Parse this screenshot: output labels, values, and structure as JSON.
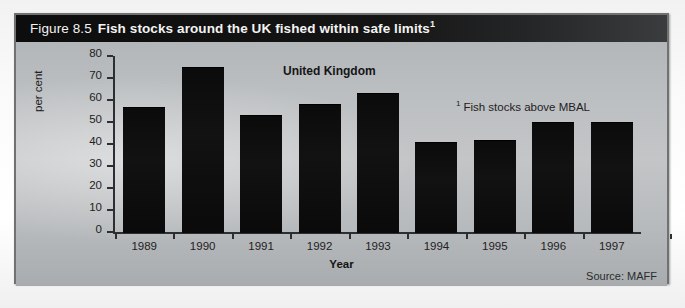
{
  "figure": {
    "number": "Figure 8.5",
    "title": "Fish stocks around the UK fished within safe limits",
    "title_footnote_marker": "1",
    "source": "Source: MAFF",
    "country_annotation": "United Kingdom",
    "footnote_marker": "1",
    "footnote_text": "Fish stocks above MBAL",
    "frame_color": "#6f7173",
    "header_background": "#0d0d0e",
    "header_text_color": "#f3f3f3",
    "bar_color": "#0b0b0c",
    "plot_background": "#bcbfc1"
  },
  "chart_data": {
    "type": "bar",
    "title": "Fish stocks around the UK fished within safe limits",
    "xlabel": "Year",
    "ylabel": "per cent",
    "categories": [
      "1989",
      "1990",
      "1991",
      "1992",
      "1993",
      "1994",
      "1995",
      "1996",
      "1997"
    ],
    "values": [
      57,
      75,
      53,
      58,
      63,
      41,
      42,
      50,
      50
    ],
    "ylim": [
      0,
      80
    ],
    "yticks": [
      0,
      10,
      20,
      30,
      40,
      50,
      60,
      70,
      80
    ],
    "ytick_labels": [
      "0",
      "10",
      "20",
      "30",
      "40",
      "50",
      "60",
      "70",
      "80"
    ],
    "grid": false,
    "legend": false,
    "annotations": [
      {
        "text": "United Kingdom",
        "position": "top-center"
      },
      {
        "text": "¹ Fish stocks above MBAL",
        "position": "upper-right"
      }
    ]
  }
}
